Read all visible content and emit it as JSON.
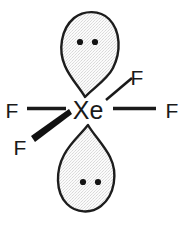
{
  "figure": {
    "name": "xenon-tetrafluoride-lewis-structure",
    "background_color": "#ffffff",
    "line_color": "#1a1a1a",
    "lobe_fill_color": "#f0f0f0",
    "lobe_outline_color": "#1d1d1d",
    "dot_color": "#141414"
  },
  "central_atom": {
    "label": "Xe",
    "x": 88,
    "y": 110
  },
  "ligands": [
    {
      "id": "f-left",
      "label": "F",
      "x": 12,
      "y": 110,
      "bond_style": "plain-line",
      "direction": "left"
    },
    {
      "id": "f-right",
      "label": "F",
      "x": 172,
      "y": 110,
      "bond_style": "plain-line",
      "direction": "right"
    },
    {
      "id": "f-upper-right",
      "label": "F",
      "x": 137,
      "y": 77,
      "bond_style": "plain-line",
      "direction": "upper-right"
    },
    {
      "id": "f-lower-left",
      "label": "F",
      "x": 20,
      "y": 147,
      "bond_style": "bold-wedge",
      "direction": "lower-left"
    }
  ],
  "lone_pairs": [
    {
      "id": "lone-pair-top",
      "position": "top",
      "dot_count": 2,
      "dots_x": [
        80,
        95
      ],
      "dots_y": 42
    },
    {
      "id": "lone-pair-bottom",
      "position": "bottom",
      "dot_count": 2,
      "dots_x": [
        83,
        98
      ],
      "dots_y": 182
    }
  ],
  "orbital_lobes": [
    {
      "id": "lobe-top",
      "orientation": "point-down",
      "tip_x": 85,
      "tip_y": 97,
      "bulb_center_y": 45
    },
    {
      "id": "lobe-bottom",
      "orientation": "point-up",
      "tip_x": 88,
      "tip_y": 125,
      "bulb_center_y": 178
    }
  ],
  "bonds": [
    {
      "id": "bond-left",
      "from": "Xe",
      "to": "F",
      "style": "plain-line"
    },
    {
      "id": "bond-right",
      "from": "Xe",
      "to": "F",
      "style": "plain-line"
    },
    {
      "id": "bond-upper-right",
      "from": "Xe",
      "to": "F",
      "style": "plain-line"
    },
    {
      "id": "bond-lower-left",
      "from": "Xe",
      "to": "F",
      "style": "bold-wedge"
    }
  ]
}
